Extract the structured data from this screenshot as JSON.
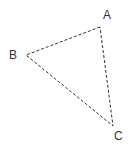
{
  "diagram": {
    "type": "triangle",
    "line_style": "dashed",
    "stroke_color": "#333333",
    "vertices": [
      {
        "label": "A",
        "x": 100,
        "y": 27,
        "label_x": 103,
        "label_y": 19
      },
      {
        "label": "B",
        "x": 26,
        "y": 55,
        "label_x": 9,
        "label_y": 59
      },
      {
        "label": "C",
        "x": 113,
        "y": 126,
        "label_x": 114,
        "label_y": 140
      }
    ]
  }
}
